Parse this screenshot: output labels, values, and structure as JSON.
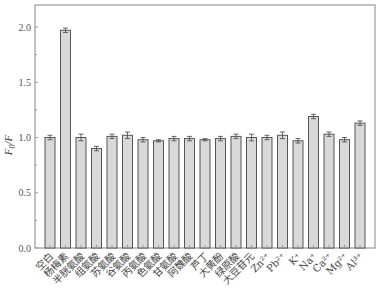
{
  "chart_data": {
    "type": "bar",
    "title": "",
    "xlabel": "",
    "ylabel": "F0/F",
    "ylabel_parts": {
      "main": "F",
      "sub": "0",
      "rest": "/F"
    },
    "ylim": [
      0,
      2.2
    ],
    "yticks": [
      0.0,
      0.5,
      1.0,
      1.5,
      2.0
    ],
    "ytick_labels": [
      "0.0",
      "0.5",
      "1.0",
      "1.5",
      "2.0"
    ],
    "grid": false,
    "legend": null,
    "categories": [
      "空白",
      "杨梅素",
      "半胱氨酸",
      "组氨酸",
      "苏氨酸",
      "谷氨酸",
      "丙氨酸",
      "色氨酸",
      "甘氨酸",
      "阿魏酸",
      "芦丁",
      "大黄酚",
      "绿原酸",
      "大豆苷元",
      "Zn²⁺",
      "Pb²⁺",
      "K⁺",
      "Na⁺",
      "Ca²⁺",
      "Mg²⁺",
      "Al³⁺"
    ],
    "values": [
      1.0,
      1.97,
      1.0,
      0.9,
      1.01,
      1.02,
      0.98,
      0.97,
      0.99,
      0.99,
      0.98,
      0.99,
      1.01,
      1.0,
      1.0,
      1.02,
      0.97,
      1.19,
      1.03,
      0.98,
      1.13
    ],
    "errors": [
      0.02,
      0.02,
      0.03,
      0.02,
      0.02,
      0.03,
      0.02,
      0.01,
      0.02,
      0.02,
      0.01,
      0.02,
      0.02,
      0.03,
      0.02,
      0.03,
      0.02,
      0.02,
      0.02,
      0.02,
      0.02
    ],
    "colors": {
      "bar_fill": "#d9d9d9",
      "bar_stroke": "#555555",
      "axis": "#999999",
      "error": "#444444"
    }
  }
}
